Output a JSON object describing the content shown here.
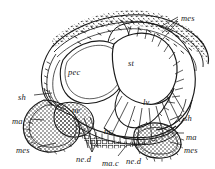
{
  "figure": {
    "kind": "anatomical-cross-section-line-drawing",
    "technique": "engraving / stipple and hatch line art",
    "ink_color": "#1a1a1a",
    "background_color": "#ffffff",
    "labels": [
      {
        "id": "mes-top-right",
        "text": "mes",
        "x": 181,
        "y": 14,
        "leader": true
      },
      {
        "id": "pec",
        "text": "pec",
        "x": 68,
        "y": 68,
        "leader": false
      },
      {
        "id": "st",
        "text": "st",
        "x": 128,
        "y": 59,
        "leader": false
      },
      {
        "id": "lv",
        "text": "lv",
        "x": 143,
        "y": 98,
        "leader": false
      },
      {
        "id": "sh-left",
        "text": "sh",
        "x": 18,
        "y": 93,
        "leader": true
      },
      {
        "id": "ma-left",
        "text": "ma",
        "x": 12,
        "y": 117,
        "leader": true
      },
      {
        "id": "ne",
        "text": "ne",
        "x": 72,
        "y": 106,
        "leader": false
      },
      {
        "id": "mes-bottom-left",
        "text": "mes",
        "x": 16,
        "y": 146,
        "leader": true
      },
      {
        "id": "ne-d-left",
        "text": "ne.d",
        "x": 76,
        "y": 155,
        "leader": true
      },
      {
        "id": "ma-c",
        "text": "ma.c",
        "x": 102,
        "y": 159,
        "leader": true
      },
      {
        "id": "ne-d-right",
        "text": "ne.d",
        "x": 126,
        "y": 157,
        "leader": true
      },
      {
        "id": "nc",
        "text": "nc",
        "x": 104,
        "y": 127,
        "leader": false
      },
      {
        "id": "sh-right",
        "text": "sh",
        "x": 184,
        "y": 114,
        "leader": true
      },
      {
        "id": "ma-right",
        "text": "ma",
        "x": 186,
        "y": 133,
        "leader": true
      },
      {
        "id": "mes-bottom-right",
        "text": "mes",
        "x": 184,
        "y": 146,
        "leader": true
      }
    ],
    "structures": [
      {
        "id": "pec-cavity",
        "label": "pec",
        "description": "large left cavity"
      },
      {
        "id": "st-cavity",
        "label": "st",
        "description": "upper right cavity"
      },
      {
        "id": "lv-cavity",
        "label": "lv",
        "description": "lower right cavity"
      },
      {
        "id": "shell-band",
        "label": "sh",
        "description": "outer layered shell band"
      },
      {
        "id": "mantle-lobe",
        "label": "ma",
        "description": "stippled mantle lobes"
      },
      {
        "id": "mesoderm",
        "label": "mes",
        "description": "speckled mesoderm tissue"
      },
      {
        "id": "nerve",
        "label": "ne",
        "description": "nerve mass"
      },
      {
        "id": "nerve-cord",
        "label": "nc",
        "description": "nerve cord"
      }
    ]
  }
}
